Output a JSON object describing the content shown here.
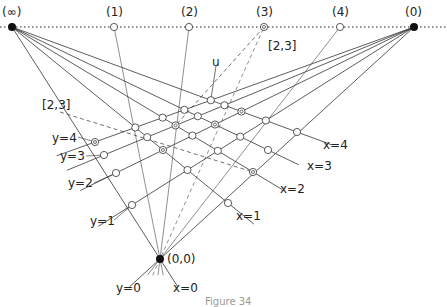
{
  "figure": {
    "caption": "Figure 34",
    "vanishing_points": {
      "infinity": {
        "label": "(∞)",
        "x": 12,
        "y": 27
      },
      "zero": {
        "label": "(0)",
        "x": 414,
        "y": 27
      }
    },
    "horizon_points": [
      {
        "label": "(1)",
        "x": 114,
        "y": 27,
        "style": "open"
      },
      {
        "label": "(2)",
        "x": 189,
        "y": 27,
        "style": "open"
      },
      {
        "label": "(3)",
        "x": 264,
        "y": 27,
        "style": "double"
      },
      {
        "label": "(4)",
        "x": 340,
        "y": 27,
        "style": "open"
      }
    ],
    "origin": {
      "label": "(0,0)",
      "x": 160,
      "y": 259
    },
    "x_axis_nodes": [
      [
        228,
        203
      ],
      [
        253,
        172
      ],
      [
        268,
        150
      ],
      [
        297,
        132
      ]
    ],
    "y_axis_nodes": [
      [
        132,
        205
      ],
      [
        116,
        173
      ],
      [
        104,
        155
      ],
      [
        95,
        142
      ]
    ],
    "labels": {
      "u": "u",
      "bracket_top": "[2,3]",
      "bracket_left": "[2,3]",
      "y0": "y=0",
      "y1": "y=1",
      "y2": "y=2",
      "y3": "y=3",
      "y4": "y=4",
      "x0": "x=0",
      "x1": "x=1",
      "x2": "x=2",
      "x3": "x=3",
      "x4": "x=4"
    }
  }
}
